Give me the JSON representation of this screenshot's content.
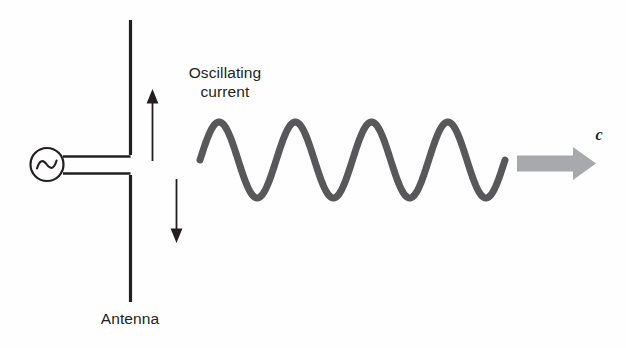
{
  "diagram": {
    "background_color": "#fefefe",
    "labels": {
      "oscillating_current": "Oscillating\ncurrent",
      "antenna": "Antenna",
      "speed_of_light": "c"
    },
    "colors": {
      "line": "#231f20",
      "wave": "#58585b",
      "arrow_block": "#a7a9ac",
      "text": "#231f20"
    },
    "elements": {
      "antenna": {
        "name": "Antenna",
        "x": 130,
        "top_segment": [
          20,
          155
        ],
        "bottom_segment": [
          175,
          302
        ],
        "stroke_width": 3.2
      },
      "ac_source": {
        "name": "AC source",
        "symbol": "sine-wave-in-circle",
        "cx": 47,
        "cy": 164,
        "r": 16,
        "stroke_width": 2
      },
      "feed_wires": {
        "upper": "from source to antenna top segment",
        "lower": "from source to antenna bottom segment"
      },
      "current_arrow_up": {
        "x": 152,
        "y_from": 160,
        "y_to": 91,
        "direction": "up"
      },
      "current_arrow_down": {
        "x": 176,
        "y_from": 180,
        "y_to": 242,
        "direction": "down"
      },
      "block_arrow": {
        "x_from": 517,
        "x_to": 596,
        "cy": 163,
        "direction": "right",
        "fill": "#a7a9ac"
      }
    }
  },
  "chart_data": {
    "type": "line",
    "xlabel": "",
    "ylabel": "",
    "grid": false,
    "legend": null,
    "waveform": {
      "shape": "sine",
      "cycles": 4,
      "x_start": 200,
      "x_end": 505,
      "period_px": 76.25,
      "centerline_y": 160,
      "amplitude_px": 38,
      "peak_y": 122,
      "trough_y": 198,
      "phase_start": "rising-from-centerline",
      "stroke_width": 7,
      "stroke_color": "#58585b"
    },
    "annotations": [
      {
        "text": "Oscillating\ncurrent",
        "x": 225,
        "y": 82
      },
      {
        "text": "Antenna",
        "x": 130,
        "y": 319
      },
      {
        "text": "c",
        "x": 599,
        "y": 134
      }
    ]
  }
}
